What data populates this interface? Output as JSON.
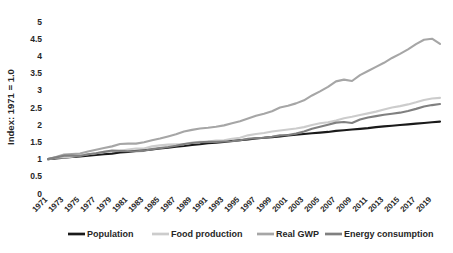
{
  "chart_data": {
    "type": "line",
    "title": "",
    "xlabel": "",
    "ylabel": "Index: 1971 = 1.0",
    "ylim": [
      0,
      5
    ],
    "ytick_step": 0.5,
    "yticks": [
      "0",
      "0.5",
      "1",
      "1.5",
      "2",
      "2.5",
      "3",
      "3.5",
      "4",
      "4.5",
      "5"
    ],
    "grid": false,
    "legend_position": "bottom",
    "xlim": [
      1971,
      2020
    ],
    "x": [
      1971,
      1972,
      1973,
      1974,
      1975,
      1976,
      1977,
      1978,
      1979,
      1980,
      1981,
      1982,
      1983,
      1984,
      1985,
      1986,
      1987,
      1988,
      1989,
      1990,
      1991,
      1992,
      1993,
      1994,
      1995,
      1996,
      1997,
      1998,
      1999,
      2000,
      2001,
      2002,
      2003,
      2004,
      2005,
      2006,
      2007,
      2008,
      2009,
      2010,
      2011,
      2012,
      2013,
      2014,
      2015,
      2016,
      2017,
      2018,
      2019,
      2020
    ],
    "xticks": [
      "1971",
      "1973",
      "1975",
      "1977",
      "1979",
      "1981",
      "1983",
      "1985",
      "1987",
      "1989",
      "1991",
      "1993",
      "1995",
      "1997",
      "1999",
      "2001",
      "2003",
      "2005",
      "2007",
      "2009",
      "2011",
      "2013",
      "2015",
      "2017",
      "2019"
    ],
    "series": [
      {
        "name": "Population",
        "color": "#1a1a1a",
        "width": 2.1,
        "values": [
          1.0,
          1.02,
          1.04,
          1.06,
          1.08,
          1.1,
          1.12,
          1.14,
          1.16,
          1.19,
          1.21,
          1.24,
          1.26,
          1.28,
          1.31,
          1.33,
          1.36,
          1.38,
          1.41,
          1.43,
          1.46,
          1.48,
          1.5,
          1.53,
          1.55,
          1.57,
          1.6,
          1.62,
          1.64,
          1.66,
          1.69,
          1.71,
          1.73,
          1.75,
          1.77,
          1.79,
          1.82,
          1.84,
          1.86,
          1.88,
          1.9,
          1.93,
          1.95,
          1.97,
          1.99,
          2.01,
          2.03,
          2.05,
          2.07,
          2.09
        ]
      },
      {
        "name": "Food production",
        "color": "#cccccc",
        "width": 2.1,
        "values": [
          1.0,
          1.04,
          1.05,
          1.07,
          1.11,
          1.14,
          1.17,
          1.21,
          1.23,
          1.24,
          1.28,
          1.31,
          1.31,
          1.37,
          1.4,
          1.42,
          1.43,
          1.43,
          1.48,
          1.5,
          1.51,
          1.54,
          1.55,
          1.59,
          1.62,
          1.69,
          1.73,
          1.76,
          1.8,
          1.83,
          1.86,
          1.89,
          1.93,
          1.99,
          2.04,
          2.07,
          2.12,
          2.19,
          2.23,
          2.28,
          2.33,
          2.38,
          2.44,
          2.5,
          2.54,
          2.59,
          2.65,
          2.72,
          2.76,
          2.78
        ]
      },
      {
        "name": "Real GWP",
        "color": "#a6a6a6",
        "width": 2.1,
        "values": [
          1.0,
          1.06,
          1.13,
          1.15,
          1.16,
          1.22,
          1.27,
          1.32,
          1.37,
          1.44,
          1.45,
          1.45,
          1.49,
          1.55,
          1.6,
          1.66,
          1.72,
          1.8,
          1.85,
          1.89,
          1.91,
          1.94,
          1.98,
          2.04,
          2.1,
          2.18,
          2.26,
          2.32,
          2.39,
          2.5,
          2.55,
          2.62,
          2.71,
          2.85,
          2.97,
          3.1,
          3.26,
          3.31,
          3.27,
          3.44,
          3.56,
          3.68,
          3.8,
          3.94,
          4.06,
          4.19,
          4.34,
          4.47,
          4.5,
          4.35
        ]
      },
      {
        "name": "Energy consumption",
        "color": "#808080",
        "width": 2.1,
        "values": [
          1.0,
          1.05,
          1.1,
          1.1,
          1.09,
          1.14,
          1.17,
          1.21,
          1.25,
          1.24,
          1.23,
          1.23,
          1.24,
          1.29,
          1.32,
          1.35,
          1.39,
          1.44,
          1.47,
          1.49,
          1.5,
          1.5,
          1.51,
          1.52,
          1.55,
          1.59,
          1.61,
          1.62,
          1.65,
          1.69,
          1.7,
          1.74,
          1.8,
          1.88,
          1.94,
          2.0,
          2.06,
          2.08,
          2.05,
          2.15,
          2.21,
          2.25,
          2.29,
          2.32,
          2.35,
          2.4,
          2.46,
          2.53,
          2.57,
          2.6
        ]
      }
    ]
  },
  "legend": {
    "items": [
      {
        "label": "Population"
      },
      {
        "label": "Food production"
      },
      {
        "label": "Real GWP"
      },
      {
        "label": "Energy consumption"
      }
    ]
  }
}
